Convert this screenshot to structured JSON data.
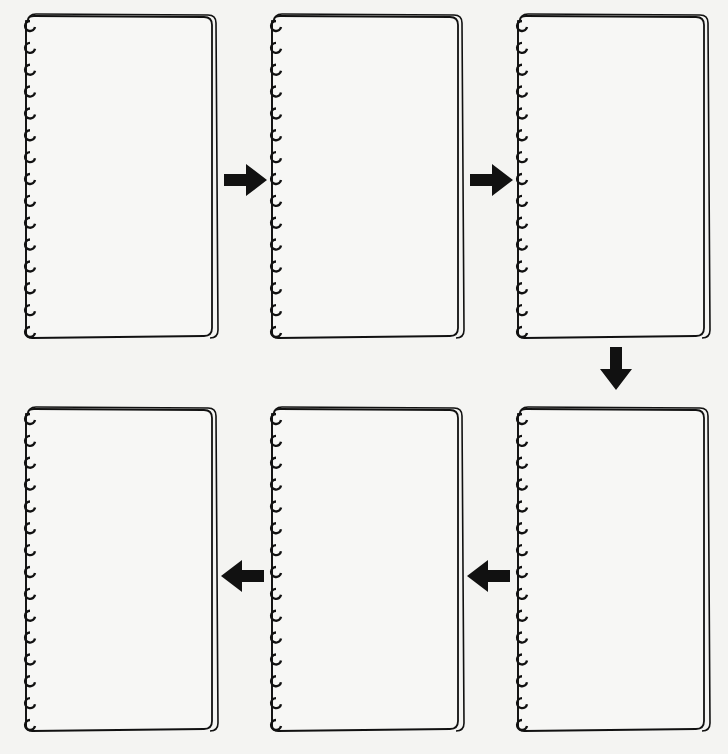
{
  "diagram": {
    "type": "sequence-flow",
    "colors": {
      "background": "#f4f4f2",
      "stroke": "#111111",
      "page": "#f7f7f5"
    },
    "pages": [
      {
        "id": 1,
        "row": 1,
        "col": 1,
        "content": ""
      },
      {
        "id": 2,
        "row": 1,
        "col": 2,
        "content": ""
      },
      {
        "id": 3,
        "row": 1,
        "col": 3,
        "content": ""
      },
      {
        "id": 4,
        "row": 2,
        "col": 3,
        "content": ""
      },
      {
        "id": 5,
        "row": 2,
        "col": 2,
        "content": ""
      },
      {
        "id": 6,
        "row": 2,
        "col": 1,
        "content": ""
      }
    ],
    "arrows": [
      {
        "from": 1,
        "to": 2,
        "direction": "right"
      },
      {
        "from": 2,
        "to": 3,
        "direction": "right"
      },
      {
        "from": 3,
        "to": 4,
        "direction": "down"
      },
      {
        "from": 4,
        "to": 5,
        "direction": "left"
      },
      {
        "from": 5,
        "to": 6,
        "direction": "left"
      }
    ]
  }
}
